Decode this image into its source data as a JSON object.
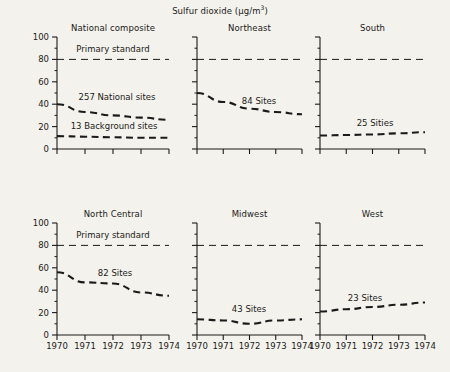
{
  "figure": {
    "main_title": "Sulfur dioxide (µg/m",
    "main_title_exponent": "3",
    "main_title_tail": ")",
    "background_color": "#f4f2ec",
    "line_color": "#1a1a1a"
  },
  "axis": {
    "y_ticks": [
      "0",
      "20",
      "40",
      "60",
      "80",
      "100"
    ],
    "x_ticks": [
      "1970",
      "1971",
      "1972",
      "1973",
      "1974"
    ]
  },
  "panels": {
    "national": {
      "title": "National composite",
      "standard_label": "Primary standard",
      "series_a_label": "257 National sites",
      "series_b_label": "13 Background sites"
    },
    "northeast": {
      "title": "Northeast",
      "series_label": "84 Sites"
    },
    "south": {
      "title": "South",
      "series_label": "25 Sities"
    },
    "northcentral": {
      "title": "North Central",
      "standard_label": "Primary standard",
      "series_label": "82 Sites"
    },
    "midwest": {
      "title": "Midwest",
      "series_label": "43 Sites"
    },
    "west": {
      "title": "West",
      "series_label": "23 Sites"
    }
  },
  "chart_data": {
    "type": "line",
    "title": "Sulfur dioxide (µg/m3)",
    "xlabel": "",
    "ylabel": "Sulfur dioxide (µg/m3)",
    "x": [
      1970,
      1971,
      1972,
      1973,
      1974
    ],
    "xlim": [
      1970,
      1974
    ],
    "ylim": [
      0,
      100
    ],
    "ytick_values": [
      0,
      20,
      40,
      60,
      80,
      100
    ],
    "yminor_step": 10,
    "grid": false,
    "legend": "inline-annotations",
    "linestyle": "dashed",
    "reference_line": {
      "label": "Primary standard",
      "value": 80,
      "style": "dashed"
    },
    "panels": [
      {
        "name": "National composite",
        "row": 0,
        "col": 0,
        "y_axis_labeled": true,
        "reference_line_labeled": true,
        "series": [
          {
            "name": "257 National sites",
            "values": [
              40,
              33,
              30,
              28,
              26
            ]
          },
          {
            "name": "13 Background sites",
            "values": [
              11.5,
              11,
              10.5,
              10,
              10
            ]
          }
        ]
      },
      {
        "name": "Northeast",
        "row": 0,
        "col": 1,
        "y_axis_labeled": false,
        "reference_line_labeled": false,
        "series": [
          {
            "name": "84 Sites",
            "values": [
              50,
              42,
              36,
              33,
              31
            ]
          }
        ]
      },
      {
        "name": "South",
        "row": 0,
        "col": 2,
        "y_axis_labeled": false,
        "reference_line_labeled": false,
        "series": [
          {
            "name": "25 Sities",
            "values": [
              12,
              12.5,
              13,
              14,
              15
            ]
          }
        ]
      },
      {
        "name": "North Central",
        "row": 1,
        "col": 0,
        "y_axis_labeled": true,
        "reference_line_labeled": true,
        "series": [
          {
            "name": "82 Sites",
            "values": [
              56,
              47,
              46,
              38,
              35
            ]
          }
        ]
      },
      {
        "name": "Midwest",
        "row": 1,
        "col": 1,
        "y_axis_labeled": false,
        "reference_line_labeled": false,
        "series": [
          {
            "name": "43 Sites",
            "values": [
              14,
              13,
              10,
              13,
              14
            ]
          }
        ]
      },
      {
        "name": "West",
        "row": 1,
        "col": 2,
        "y_axis_labeled": false,
        "reference_line_labeled": false,
        "series": [
          {
            "name": "23 Sites",
            "values": [
              21,
              23,
              25,
              27,
              29
            ]
          }
        ]
      }
    ]
  }
}
